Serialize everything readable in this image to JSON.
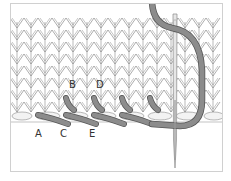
{
  "figure": {
    "labels": {
      "a": "A",
      "b": "B",
      "c": "C",
      "d": "D",
      "e": "E"
    },
    "colors": {
      "frame": "#d0d0d0",
      "background": "#ffffff",
      "stitch_line": "#8a8a8a",
      "yarn": "#8c8c8c",
      "yarn_outline": "#555555",
      "needle": "#bdbdbd",
      "label": "#333333"
    }
  }
}
